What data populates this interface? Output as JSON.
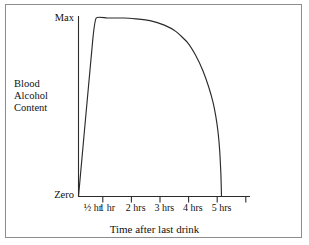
{
  "chart_data": {
    "type": "line",
    "title": "",
    "subtitle": "",
    "xlabel": "Time after last drink",
    "ylabel": "Blood Alcohol Content",
    "ylabel_lines": [
      "Blood",
      "Alcohol",
      "Content"
    ],
    "ytick_labels": [
      "Max",
      "Zero"
    ],
    "ylim": [
      0,
      1
    ],
    "yticks": [
      1,
      0
    ],
    "grid": false,
    "legend": null,
    "xtick_labels": [
      "½ hr",
      "1 hr",
      "2 hrs",
      "3 hrs",
      "4 hrs",
      "5 hrs"
    ],
    "xticks_hours": [
      0.5,
      1,
      2,
      3,
      4,
      5
    ],
    "xlim": [
      0,
      6
    ],
    "annotations": [],
    "series": [
      {
        "name": "Blood Alcohol Content",
        "description": "Steep linear rise from zero to maximum, flat plateau, then a decaying fall back to zero at 5 hrs",
        "x": [
          0,
          0.5,
          0.62,
          1.0,
          1.6,
          2.0,
          2.5,
          3.0,
          3.4,
          3.8,
          4.1,
          4.35,
          4.55,
          4.7,
          4.8,
          4.88,
          4.94,
          4.98,
          5.0
        ],
        "y": [
          0.0,
          0.88,
          1.0,
          1.0,
          1.0,
          0.995,
          0.985,
          0.96,
          0.925,
          0.865,
          0.79,
          0.705,
          0.615,
          0.53,
          0.45,
          0.36,
          0.25,
          0.12,
          0.0
        ]
      }
    ]
  },
  "figure": {
    "axis_color": "#2b2b2b",
    "curve_color": "#2b2b2b",
    "frame_color": "#8d8d8d",
    "background": "#ffffff"
  }
}
